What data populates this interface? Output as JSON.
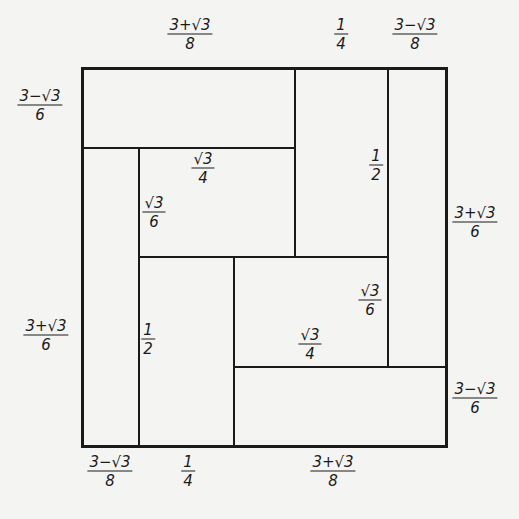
{
  "diagram": {
    "outer_square": {
      "left": 82,
      "top": 68,
      "right": 446,
      "bottom": 446
    },
    "line_color": "#1a1a1a",
    "background": "#f4f4f2",
    "lines": [
      {
        "orient": "h",
        "x1": 82,
        "x2": 295,
        "y": 148
      },
      {
        "orient": "v",
        "x": 295,
        "y1": 68,
        "y2": 257
      },
      {
        "orient": "v",
        "x": 388,
        "y1": 68,
        "y2": 367
      },
      {
        "orient": "v",
        "x": 139,
        "y1": 148,
        "y2": 446
      },
      {
        "orient": "h",
        "x1": 139,
        "x2": 388,
        "y": 257
      },
      {
        "orient": "v",
        "x": 234,
        "y1": 257,
        "y2": 446
      },
      {
        "orient": "h",
        "x1": 234,
        "x2": 446,
        "y": 367
      }
    ],
    "labels": [
      {
        "id": "top-left-width",
        "num": "3+√3",
        "den": "8",
        "x": 190,
        "y": 34
      },
      {
        "id": "top-mid-width",
        "num": "1",
        "den": "4",
        "x": 341,
        "y": 34
      },
      {
        "id": "top-right-width",
        "num": "3−√3",
        "den": "8",
        "x": 415,
        "y": 34
      },
      {
        "id": "left-top-height",
        "num": "3−√3",
        "den": "6",
        "x": 40,
        "y": 105
      },
      {
        "id": "inner-top-width",
        "num": "√3",
        "den": "4",
        "x": 203,
        "y": 168
      },
      {
        "id": "inner-left-height",
        "num": "√3",
        "den": "6",
        "x": 154,
        "y": 212
      },
      {
        "id": "right-col-height",
        "num": "1",
        "den": "2",
        "x": 376,
        "y": 165
      },
      {
        "id": "right-outer-height",
        "num": "3+√3",
        "den": "6",
        "x": 475,
        "y": 222
      },
      {
        "id": "left-outer-height",
        "num": "3+√3",
        "den": "6",
        "x": 46,
        "y": 335
      },
      {
        "id": "inner-mid-height",
        "num": "1",
        "den": "2",
        "x": 148,
        "y": 339
      },
      {
        "id": "center-right-height",
        "num": "√3",
        "den": "6",
        "x": 370,
        "y": 300
      },
      {
        "id": "center-width",
        "num": "√3",
        "den": "4",
        "x": 310,
        "y": 344
      },
      {
        "id": "right-bottom-height",
        "num": "3−√3",
        "den": "6",
        "x": 475,
        "y": 398
      },
      {
        "id": "bottom-left-width",
        "num": "3−√3",
        "den": "8",
        "x": 110,
        "y": 471
      },
      {
        "id": "bottom-mid-width",
        "num": "1",
        "den": "4",
        "x": 188,
        "y": 471
      },
      {
        "id": "bottom-right-width",
        "num": "3+√3",
        "den": "8",
        "x": 333,
        "y": 471
      }
    ]
  }
}
